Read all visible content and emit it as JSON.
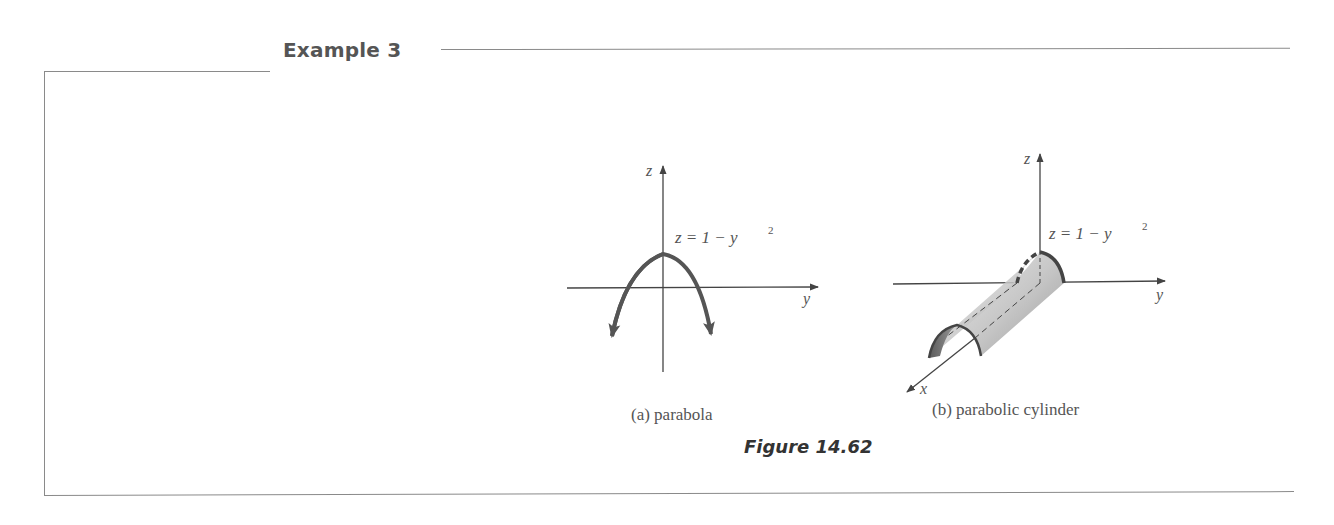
{
  "example": {
    "heading": "Example 3"
  },
  "figure": {
    "title": "Figure 14.62",
    "panels": [
      {
        "id": "a",
        "caption": "(a)  parabola",
        "equation": "z = 1 − y",
        "equation_exponent": "2",
        "axis_labels": {
          "vertical": "z",
          "horizontal": "y"
        }
      },
      {
        "id": "b",
        "caption": "(b)  parabolic cylinder",
        "equation": "z = 1 − y",
        "equation_exponent": "2",
        "axis_labels": {
          "vertical": "z",
          "horizontal": "y",
          "depth": "x"
        }
      }
    ]
  },
  "colors": {
    "frame": "#8a8a8a",
    "curve": "#555555",
    "text": "#555555"
  }
}
